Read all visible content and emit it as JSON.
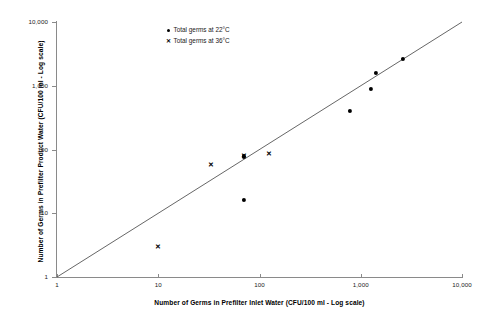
{
  "chart_data": {
    "type": "scatter",
    "title": "",
    "xlabel": "Number of Germs in Prefilter Inlet Water (CFU/100 ml - Log scale)",
    "ylabel": "Number of Germs in Prefilter Product Water (CFU/100 ml - Log scale)",
    "xscale": "log",
    "yscale": "log",
    "xlim": [
      1,
      10000
    ],
    "ylim": [
      1,
      10000
    ],
    "grid": false,
    "legend_position": "top-center",
    "xticks": [
      1,
      10,
      100,
      1000,
      10000
    ],
    "xtick_labels": [
      "1",
      "10",
      "100",
      "1,000",
      "10,000"
    ],
    "yticks": [
      1,
      10,
      100,
      1000,
      10000
    ],
    "ytick_labels": [
      "1",
      "10",
      "100",
      "1,000",
      "10,000"
    ],
    "reference_line": {
      "name": "identity-line",
      "description": "1:1 diagonal line y = x",
      "from": [
        1,
        1
      ],
      "to": [
        10000,
        10000
      ],
      "color": "#555555"
    },
    "series": [
      {
        "name": "Total germs at 22°C",
        "marker": "circle",
        "color": "#000000",
        "points": [
          {
            "x": 70,
            "y": 16
          },
          {
            "x": 70,
            "y": 78
          },
          {
            "x": 780,
            "y": 400
          },
          {
            "x": 1250,
            "y": 900
          },
          {
            "x": 1400,
            "y": 1600
          },
          {
            "x": 2600,
            "y": 2600
          }
        ]
      },
      {
        "name": "Total germs at 36°C",
        "marker": "cross",
        "color": "#000000",
        "points": [
          {
            "x": 10,
            "y": 3
          },
          {
            "x": 33,
            "y": 58
          },
          {
            "x": 70,
            "y": 78
          },
          {
            "x": 125,
            "y": 85
          }
        ]
      }
    ]
  },
  "legend": {
    "items": [
      {
        "label": "Total germs at 22°C",
        "marker": "circle"
      },
      {
        "label": "Total germs at 36°C",
        "marker": "cross"
      }
    ]
  }
}
